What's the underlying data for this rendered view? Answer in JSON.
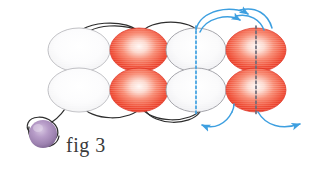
{
  "figure": {
    "caption": "fig 3",
    "title": "fig 3",
    "type": "molecular-orbital-diagram",
    "background_color": "#ffffff"
  },
  "colors": {
    "red_orbital_edge": "#e8392a",
    "red_orbital_mid": "#f4654f",
    "red_orbital_center": "#fdf0ec",
    "white_orbital_edge": "#b9b9bd",
    "white_orbital_fill": "#fbfbfc",
    "pale_orbital_edge": "#9a9aa0",
    "pale_orbital_fill": "#f6f6f7",
    "black_curve": "#2e2e2e",
    "blue_arrow": "#3d9fe0",
    "blue_dash": "#3d9fe0",
    "gray_dash": "#6b6b78",
    "sphere_light": "#cdb9da",
    "sphere_mid": "#a98cbc",
    "sphere_dark": "#7e6490",
    "caption_text": "#3a3a3a"
  },
  "orbitals": {
    "columns": [
      {
        "id": "column-1",
        "style": "white",
        "center_x": 79,
        "label": "white-orbital-pair-1",
        "dashed_axis": "none"
      },
      {
        "id": "column-2",
        "style": "red",
        "center_x": 139,
        "label": "red-orbital-pair-1",
        "dashed_axis": "none"
      },
      {
        "id": "column-3",
        "style": "pale",
        "center_x": 196,
        "label": "pale-orbital-pair-1",
        "dashed_axis": "blue"
      },
      {
        "id": "column-4",
        "style": "red",
        "center_x": 256,
        "label": "red-orbital-pair-2",
        "dashed_axis": "gray"
      }
    ],
    "rows": [
      {
        "id": "row-top",
        "center_y": 50
      },
      {
        "id": "row-bottom",
        "center_y": 90
      }
    ],
    "radius_x": 31,
    "radius_y": 22
  },
  "connectors": {
    "black_curves": [
      {
        "id": "top-arc-1",
        "label": "bond-arc-top-left"
      },
      {
        "id": "top-arc-2",
        "label": "bond-arc-top-left-inner"
      },
      {
        "id": "top-arc-3",
        "label": "bond-arc-top-right"
      },
      {
        "id": "bottom-arc-1",
        "label": "bond-arc-bottom-left"
      },
      {
        "id": "bottom-arc-2",
        "label": "bond-arc-bottom-mid"
      },
      {
        "id": "bottom-arc-3",
        "label": "bond-arc-bottom-right"
      },
      {
        "id": "tail-curve",
        "label": "tail-curve-to-sphere"
      }
    ],
    "blue_arrows": [
      {
        "id": "arrow-top-outer",
        "direction": "right",
        "label": "electron-flow-top-outer"
      },
      {
        "id": "arrow-top-inner",
        "direction": "right",
        "label": "electron-flow-top-inner"
      },
      {
        "id": "arrow-bottom-left",
        "direction": "left",
        "label": "electron-flow-bottom-left"
      },
      {
        "id": "arrow-bottom-right",
        "direction": "right",
        "label": "electron-flow-bottom-right"
      }
    ]
  },
  "sphere": {
    "label": "purple-sphere",
    "center_x": 43,
    "center_y": 134,
    "radius": 14
  }
}
